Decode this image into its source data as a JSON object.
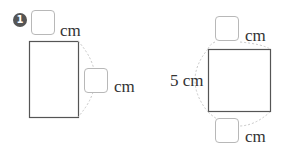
{
  "problem": {
    "marker": "1",
    "left_figure": {
      "shape": "rectangle",
      "top_unit": "cm",
      "side_unit": "cm"
    },
    "right_figure": {
      "shape": "square",
      "given_side": "5 cm",
      "top_unit": "cm",
      "bottom_unit": "cm"
    }
  }
}
